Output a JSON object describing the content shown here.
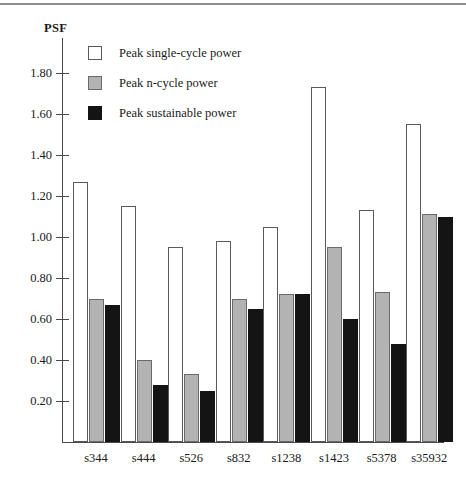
{
  "figure": {
    "y_axis_title": "PSF",
    "top_rule": "horizontal-rule"
  },
  "legend": {
    "position": "top-center-inside",
    "entries": [
      {
        "label": "Peak single-cycle power",
        "swatch": "white-square",
        "color": "#ffffff"
      },
      {
        "label": "Peak n-cycle power",
        "swatch": "gray-square",
        "color": "#b3b3b3"
      },
      {
        "label": "Peak sustainable power",
        "swatch": "black-square",
        "color": "#141414"
      }
    ]
  },
  "chart_data": {
    "type": "bar",
    "title": "",
    "subtitle": "",
    "xlabel": "",
    "ylabel": "PSF",
    "ylim": [
      0,
      1.9
    ],
    "grid": false,
    "legend_position": "top-center-inside",
    "yticks": [
      "0.20",
      "0.40",
      "0.60",
      "0.80",
      "1.00",
      "1.20",
      "1.40",
      "1.60",
      "1.80"
    ],
    "ytick_values": [
      0.2,
      0.4,
      0.6,
      0.8,
      1.0,
      1.2,
      1.4,
      1.6,
      1.8
    ],
    "categories": [
      "s344",
      "s444",
      "s526",
      "s832",
      "s1238",
      "s1423",
      "s5378",
      "s35932"
    ],
    "series": [
      {
        "name": "Peak single-cycle power",
        "color": "#ffffff",
        "values": [
          1.27,
          1.15,
          0.95,
          0.98,
          1.05,
          1.73,
          1.13,
          1.55
        ]
      },
      {
        "name": "Peak n-cycle power",
        "color": "#b3b3b3",
        "values": [
          0.7,
          0.4,
          0.33,
          0.7,
          0.72,
          0.95,
          0.73,
          1.11
        ]
      },
      {
        "name": "Peak sustainable power",
        "color": "#141414",
        "values": [
          0.67,
          0.28,
          0.25,
          0.65,
          0.72,
          0.6,
          0.48,
          1.1
        ]
      }
    ]
  }
}
